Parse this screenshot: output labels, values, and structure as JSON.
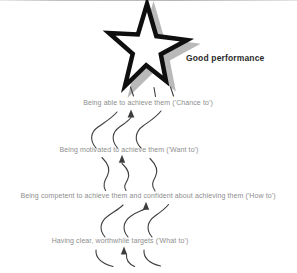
{
  "diagram": {
    "title_label": "Good performance",
    "levels": [
      {
        "id": "chance-to",
        "text": "Being able to achieve them ('Chance to')"
      },
      {
        "id": "want-to",
        "text": "Being motivated to achieve them ('Want to')"
      },
      {
        "id": "how-to",
        "text": "Being competent to achieve them and confident about achieving them ('How to')"
      },
      {
        "id": "what-to",
        "text": "Having clear, worthwhile targets ('What to')"
      }
    ],
    "colors": {
      "background": "#ffffff",
      "level_text": "#8e8e8e",
      "arrow": "#3d3d3d",
      "star_outline": "#0f0f0f",
      "star_fill": "#ffffff",
      "star_shadow": "#b9b9b9",
      "label_text": "#2b2b2b",
      "top_edge_line": "#bfbfbf"
    }
  }
}
